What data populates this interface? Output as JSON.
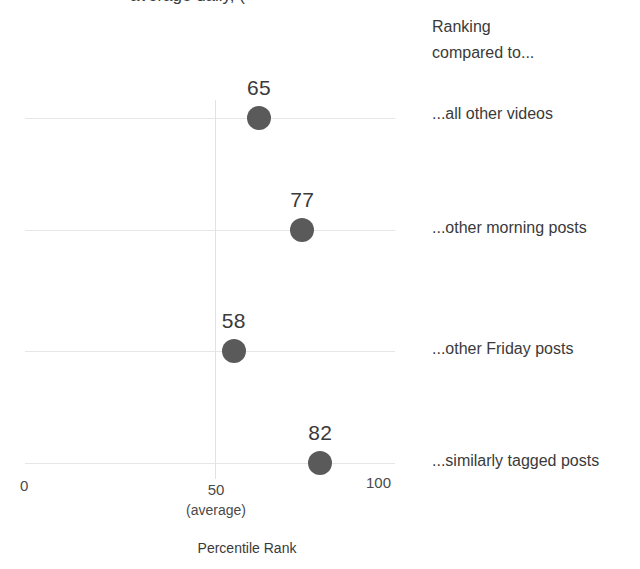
{
  "top_clipped_text": "average daily, (",
  "legend": {
    "line1": "Ranking",
    "line2": "compared to..."
  },
  "axis": {
    "title": "Percentile Rank",
    "tick_0": "0",
    "tick_50": "50",
    "tick_50_sub": "(average)",
    "tick_100": "100"
  },
  "chart_data": {
    "type": "scatter",
    "title": "",
    "subtitle": "",
    "xlabel": "Percentile Rank",
    "ylabel": "",
    "xlim": [
      0,
      100
    ],
    "grid": true,
    "legend_position": "right",
    "orientation": "horizontal",
    "categories": [
      "...all other videos",
      "...other morning posts",
      "...other Friday posts",
      "...similarly tagged posts"
    ],
    "values": [
      65,
      77,
      58,
      82
    ],
    "value_labels": [
      "65",
      "77",
      "58",
      "82"
    ],
    "reference_line": {
      "value": 50,
      "label": "(average)"
    },
    "xticks": [
      0,
      50,
      100
    ],
    "xtick_labels": [
      "0",
      "50",
      "100"
    ],
    "marker_color": "#5a5a5a",
    "gridline_color": "#e6e6e6",
    "text_color": "#3a3a3a"
  },
  "points": [
    {
      "value": 65,
      "label": "65",
      "category": "...all other videos",
      "y": 118
    },
    {
      "value": 77,
      "label": "77",
      "category": "...other morning posts",
      "y": 230
    },
    {
      "value": 58,
      "label": "58",
      "category": "...other Friday posts",
      "y": 351
    },
    {
      "value": 82,
      "label": "82",
      "category": "...similarly tagged posts",
      "y": 463
    }
  ]
}
